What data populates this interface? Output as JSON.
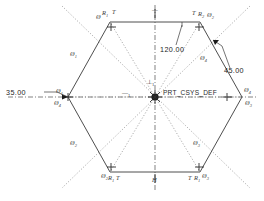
{
  "drawing": {
    "type": "cad-sketch",
    "shape": "hexagon",
    "background_color": "#ffffff",
    "line_color": "#3a3a3a",
    "construction_color": "#8a8a8a",
    "text_color": "#1c1c1c"
  },
  "dimensions": [
    {
      "id": "radius",
      "value": "35.00",
      "x": 30,
      "y": 95
    },
    {
      "id": "angle-interior",
      "value": "120.00",
      "x": 172,
      "y": 49
    },
    {
      "id": "angle-corner",
      "value": "45.00",
      "x": 226,
      "y": 72
    }
  ],
  "csys": {
    "label": "PRT_CSYS_DEF",
    "x": 164,
    "y": 94
  },
  "axis_labels": [
    {
      "id": "axis-vertical",
      "text": "⊥",
      "sub": "1",
      "x": 149,
      "y": 82
    },
    {
      "id": "axis-horizontal",
      "text": "—",
      "sub": "1",
      "x": 125,
      "y": 94
    }
  ],
  "edge_labels": [
    {
      "id": "edge-1",
      "text": "Ø",
      "sub": "1",
      "x": 72,
      "y": 54
    },
    {
      "id": "edge-2",
      "text": "Ø",
      "sub": "2",
      "x": 72,
      "y": 143
    },
    {
      "id": "edge-3",
      "text": "Ø",
      "sub": "3",
      "x": 195,
      "y": 143
    },
    {
      "id": "edge-4",
      "text": "Ø",
      "sub": "4",
      "x": 202,
      "y": 58
    }
  ],
  "vertex_labels": [
    {
      "id": "vertex-top-left-R",
      "text": "R",
      "sub": "1",
      "x": 104,
      "y": 15
    },
    {
      "id": "vertex-top-left-T",
      "text": "T",
      "sub": "",
      "x": 114,
      "y": 14
    },
    {
      "id": "vertex-top-left-phi",
      "text": "Ø",
      "sub": "",
      "x": 99,
      "y": 18
    },
    {
      "id": "vertex-top-right-T",
      "text": "T",
      "sub": "",
      "x": 196,
      "y": 15
    },
    {
      "id": "vertex-top-right-R",
      "text": "R",
      "sub": "2",
      "x": 201,
      "y": 16
    },
    {
      "id": "vertex-top-right-phi",
      "text": "Ø",
      "sub": "2",
      "x": 209,
      "y": 17
    },
    {
      "id": "vertex-right-upper",
      "text": "Ø",
      "sub": "4",
      "x": 246,
      "y": 91
    },
    {
      "id": "vertex-right-lower",
      "text": "Ø",
      "sub": "3",
      "x": 247,
      "y": 104
    },
    {
      "id": "vertex-left-upper",
      "text": "Ø",
      "sub": "1",
      "x": 58,
      "y": 92
    },
    {
      "id": "vertex-left-lower",
      "text": "Ø",
      "sub": "4",
      "x": 56,
      "y": 104
    },
    {
      "id": "vertex-bottom-left-phi",
      "text": "Ø",
      "sub": "2",
      "x": 104,
      "y": 178
    },
    {
      "id": "vertex-bottom-left-R",
      "text": "R",
      "sub": "1",
      "x": 110,
      "y": 179
    },
    {
      "id": "vertex-bottom-left-T",
      "text": "T",
      "sub": "",
      "x": 117,
      "y": 179
    },
    {
      "id": "vertex-bottom-right-T",
      "text": "T",
      "sub": "",
      "x": 190,
      "y": 179
    },
    {
      "id": "vertex-bottom-right-R",
      "text": "R",
      "sub": "1",
      "x": 196,
      "y": 179
    },
    {
      "id": "vertex-bottom-right-phi",
      "text": "Ø",
      "sub": "3",
      "x": 203,
      "y": 178
    }
  ],
  "midpoint_markers": [
    {
      "id": "midpoint-top",
      "text": "—",
      "x": 155,
      "y": 13
    },
    {
      "id": "midpoint-bottom",
      "text": "H",
      "x": 155,
      "y": 181
    }
  ],
  "caption": {
    "text": ""
  }
}
